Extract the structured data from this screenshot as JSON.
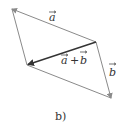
{
  "diagram": {
    "caption": "b)",
    "labels": {
      "a": "a",
      "sum_a": "a",
      "plus": "+",
      "sum_b": "b",
      "b": "b"
    },
    "vertices": {
      "top_left": [
        12,
        9
      ],
      "right_mid": [
        96,
        42
      ],
      "left_low": [
        27,
        65
      ],
      "bottom_right": [
        111,
        98
      ]
    },
    "vectors": [
      {
        "name": "a",
        "from": "right_mid",
        "to": "top_left",
        "style": "thin"
      },
      {
        "name": "b",
        "from": "right_mid",
        "to": "bottom_right",
        "style": "thin"
      },
      {
        "name": "a+b",
        "from": "right_mid",
        "to": "left_low",
        "style": "bold"
      },
      {
        "name": "a-side",
        "from": "bottom_right",
        "to": "left_low",
        "style": "thin"
      },
      {
        "name": "b-side",
        "from": "top_left",
        "to": "left_low",
        "style": "thin"
      }
    ],
    "colors": {
      "line": "#8a8a8a",
      "bold_line": "#333333",
      "text": "#333333"
    }
  }
}
